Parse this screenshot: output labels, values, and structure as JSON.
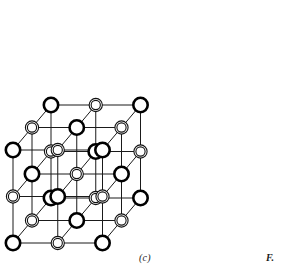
{
  "figure": {
    "kind": "crystal-lattice-diagram",
    "structure_name": "rock-salt cubic lattice",
    "panel_label": "(c)",
    "figure_ref_label": "F.",
    "width": 281,
    "height": 271,
    "background_color": "#ffffff",
    "bond_color": "#1a1a1a",
    "bond_width": 1,
    "node_types": [
      {
        "id": "A",
        "style": "thick-ring",
        "description": "large circle with single heavy black outline",
        "radius": 7.2,
        "stroke_width": 2.6,
        "stroke_color": "#000000",
        "fill_color": "#ffffff"
      },
      {
        "id": "B",
        "style": "double-ring",
        "description": "circle drawn as two thin concentric rings",
        "radius": 6.6,
        "inner_radius": 4.6,
        "stroke_width": 1.1,
        "stroke_color": "#111111",
        "fill_color": "#ffffff"
      }
    ],
    "projection": {
      "type": "oblique",
      "grid_divisions": 2,
      "origin": {
        "x": 13,
        "y": 243
      },
      "axis_x": {
        "dx": 89.5,
        "dy": 0
      },
      "axis_y": {
        "dx": 0,
        "dy": -93
      },
      "axis_z": {
        "dx": 38,
        "dy": -45
      }
    },
    "lattice": {
      "counts": {
        "i": 3,
        "j": 3,
        "k": 3
      },
      "alternation_rule": "type A when (i+j+k) is even, type B when odd",
      "total_sites": 27
    }
  },
  "chart_data": {
    "type": "scatter",
    "title": "",
    "xlabel": "",
    "ylabel": "",
    "series": [
      {
        "name": "thick-ring ion",
        "values": [
          [
            0,
            0,
            0
          ],
          [
            2,
            0,
            0
          ],
          [
            1,
            1,
            0
          ],
          [
            0,
            2,
            0
          ],
          [
            2,
            2,
            0
          ],
          [
            1,
            0,
            1
          ],
          [
            0,
            1,
            1
          ],
          [
            2,
            1,
            1
          ],
          [
            1,
            2,
            1
          ],
          [
            0,
            0,
            2
          ],
          [
            2,
            0,
            2
          ],
          [
            1,
            1,
            2
          ],
          [
            0,
            2,
            2
          ],
          [
            2,
            2,
            2
          ]
        ]
      },
      {
        "name": "double-ring ion",
        "values": [
          [
            1,
            0,
            0
          ],
          [
            0,
            1,
            0
          ],
          [
            2,
            1,
            0
          ],
          [
            1,
            2,
            0
          ],
          [
            0,
            0,
            1
          ],
          [
            2,
            0,
            1
          ],
          [
            1,
            1,
            1
          ],
          [
            0,
            2,
            1
          ],
          [
            2,
            2,
            1
          ],
          [
            1,
            0,
            2
          ],
          [
            0,
            1,
            2
          ],
          [
            2,
            1,
            2
          ],
          [
            1,
            2,
            2
          ]
        ]
      }
    ]
  }
}
